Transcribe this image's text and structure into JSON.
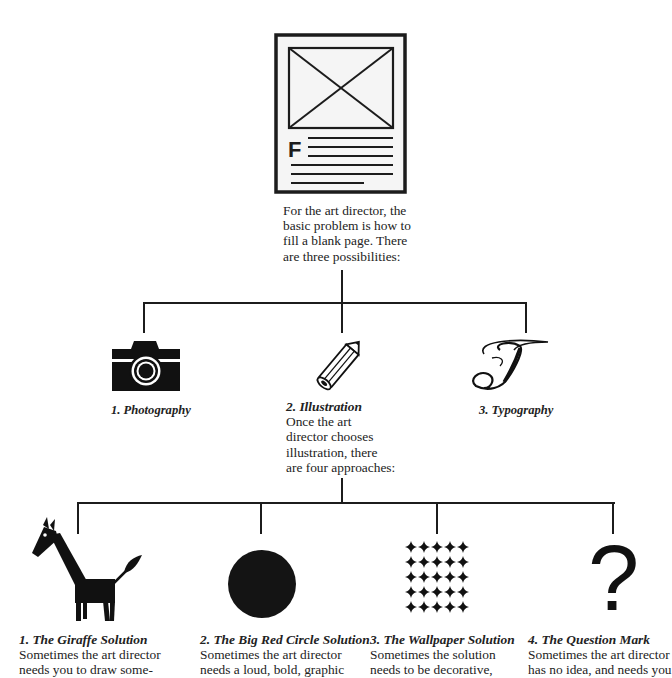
{
  "top": {
    "icon": "blank-page-layout-icon",
    "icon_letter": "F",
    "caption_lines": [
      "For the art director, the",
      "basic problem is how to",
      "fill a blank page. There",
      "are three possibilities:"
    ]
  },
  "possibilities": [
    {
      "icon": "camera-icon",
      "label": "1. Photography"
    },
    {
      "icon": "pencil-icon",
      "label": "2. Illustration",
      "body_lines": [
        "Once the art",
        "director chooses",
        "illustration, there",
        "are four approaches:"
      ]
    },
    {
      "icon": "script-t-icon",
      "label": "3. Typography",
      "glyph": "T"
    }
  ],
  "approaches": [
    {
      "icon": "giraffe-icon",
      "title": "1. The Giraffe Solution",
      "body_lines": [
        "Sometimes the art director",
        "needs you to draw some-"
      ]
    },
    {
      "icon": "big-circle-icon",
      "title": "2. The Big Red Circle Solution",
      "body_lines": [
        "Sometimes the art director",
        "needs a loud, bold, graphic"
      ]
    },
    {
      "icon": "wallpaper-pattern-icon",
      "title": "3. The Wallpaper Solution",
      "body_lines": [
        "Sometimes the solution",
        "needs to be decorative,"
      ]
    },
    {
      "icon": "question-mark-icon",
      "title": "4. The Question Mark",
      "glyph": "?",
      "body_lines": [
        "Sometimes the art director",
        "has no idea, and needs you"
      ]
    }
  ],
  "colors": {
    "ink": "#1c1c1c",
    "paper": "#ffffff",
    "page_fill": "#f4f4f4"
  }
}
